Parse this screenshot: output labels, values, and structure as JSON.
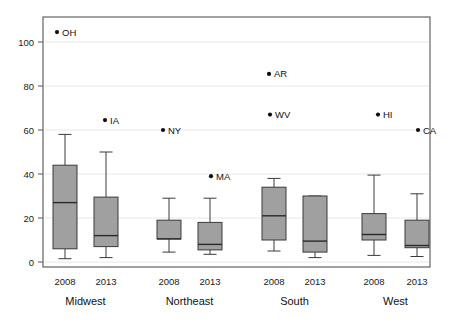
{
  "chart_data": {
    "type": "box",
    "title": "",
    "xlabel": "",
    "ylabel": "",
    "ylim": [
      0,
      113
    ],
    "yticks": [
      0,
      20,
      40,
      60,
      80,
      100
    ],
    "ytick_labels": [
      "0",
      "20",
      "40",
      "60",
      "80",
      "100"
    ],
    "grid": "horizontal",
    "legend": "none",
    "groups": [
      "Midwest",
      "Northeast",
      "South",
      "West"
    ],
    "years": [
      "2008",
      "2013"
    ],
    "boxes": [
      {
        "group": "Midwest",
        "year": "2008",
        "whisker_low": 1.5,
        "q1": 6.0,
        "median": 27.0,
        "q3": 44.0,
        "whisker_high": 58.0
      },
      {
        "group": "Midwest",
        "year": "2013",
        "whisker_low": 2.0,
        "q1": 7.0,
        "median": 12.0,
        "q3": 29.5,
        "whisker_high": 50.0
      },
      {
        "group": "Northeast",
        "year": "2008",
        "whisker_low": 4.5,
        "q1": 10.5,
        "median": 10.5,
        "q3": 19.0,
        "whisker_high": 29.0
      },
      {
        "group": "Northeast",
        "year": "2013",
        "whisker_low": 3.5,
        "q1": 5.5,
        "median": 8.0,
        "q3": 18.0,
        "whisker_high": 29.0
      },
      {
        "group": "South",
        "year": "2008",
        "whisker_low": 5.0,
        "q1": 10.0,
        "median": 21.0,
        "q3": 34.0,
        "whisker_high": 38.0
      },
      {
        "group": "South",
        "year": "2013",
        "whisker_low": 2.0,
        "q1": 4.5,
        "median": 9.5,
        "q3": 30.0,
        "whisker_high": 30.0
      },
      {
        "group": "West",
        "year": "2008",
        "whisker_low": 3.0,
        "q1": 10.0,
        "median": 12.5,
        "q3": 22.0,
        "whisker_high": 39.5
      },
      {
        "group": "West",
        "year": "2013",
        "whisker_low": 2.5,
        "q1": 6.5,
        "median": 7.5,
        "q3": 19.0,
        "whisker_high": 31.0
      }
    ],
    "outliers": [
      {
        "label": "OH",
        "group": "Midwest",
        "year": "2008",
        "value": 104.5
      },
      {
        "label": "IA",
        "group": "Midwest",
        "year": "2013",
        "value": 64.5
      },
      {
        "label": "NY",
        "group": "Northeast",
        "year": "2008",
        "value": 60.0
      },
      {
        "label": "MA",
        "group": "Northeast",
        "year": "2013",
        "value": 39.0
      },
      {
        "label": "AR",
        "group": "South",
        "year": "2008",
        "value": 85.5
      },
      {
        "label": "WV",
        "group": "South",
        "year": "2013",
        "value": 67.0
      },
      {
        "label": "HI",
        "group": "West",
        "year": "2008",
        "value": 67.0
      },
      {
        "label": "CA",
        "group": "West",
        "year": "2013",
        "value": 60.0
      }
    ],
    "colors": {
      "box_fill": "#a0a0a0",
      "box_stroke": "#3a3a3a",
      "median_stroke": "#2a2a2a",
      "whisker_stroke": "#3a3a3a",
      "grid": "#e8e8e8",
      "frame": "#555555",
      "outlier_dot": "#101010",
      "text": "#111111"
    }
  },
  "axes": {
    "y_ticks": [
      "0",
      "20",
      "40",
      "60",
      "80",
      "100"
    ],
    "x_year_ticks": [
      "2008",
      "2013",
      "2008",
      "2013",
      "2008",
      "2013",
      "2008",
      "2013"
    ],
    "x_group_ticks": [
      "Midwest",
      "Northeast",
      "South",
      "West"
    ]
  }
}
